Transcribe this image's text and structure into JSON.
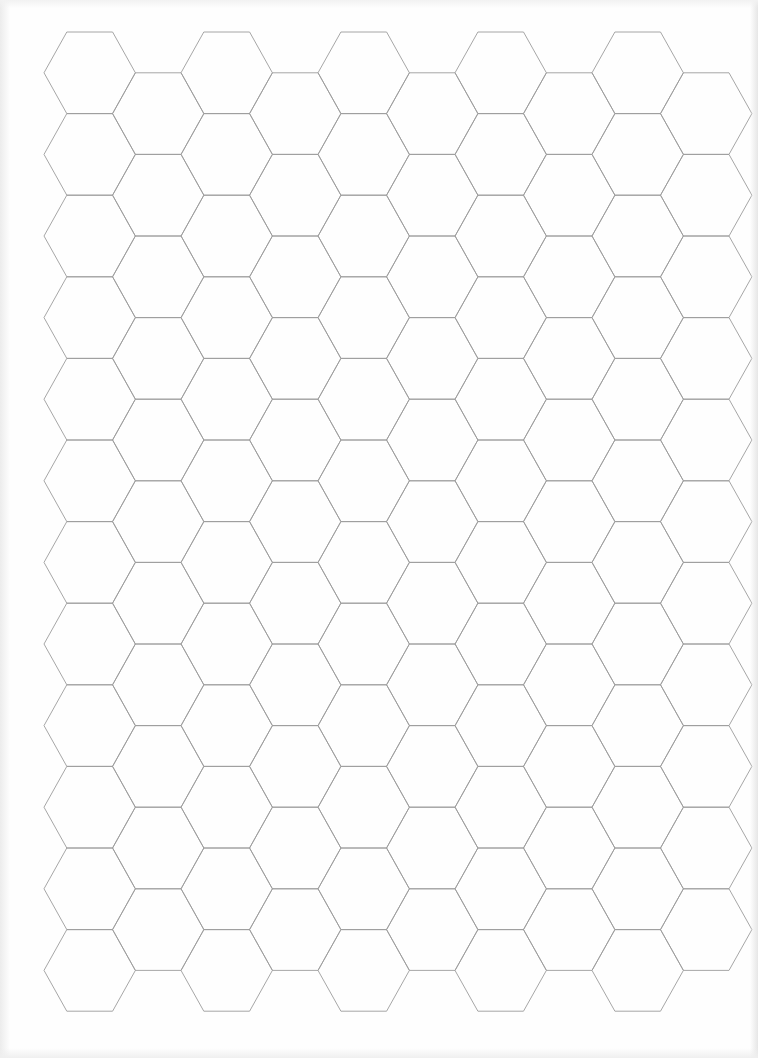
{
  "page": {
    "type": "hexagonal graph paper",
    "width": 758,
    "height": 1058,
    "background_color": "#fefefe"
  },
  "grid": {
    "orientation": "flat-top",
    "line_color": "#9c9c9c",
    "line_width": 0.9,
    "columns": 10,
    "even_column_rows": 12,
    "odd_column_rows": 11,
    "origin_x": 44,
    "origin_y": 32,
    "hex_width": 91.4,
    "hex_height": 81.6,
    "column_step": 68.5,
    "row_step": 81.6
  }
}
